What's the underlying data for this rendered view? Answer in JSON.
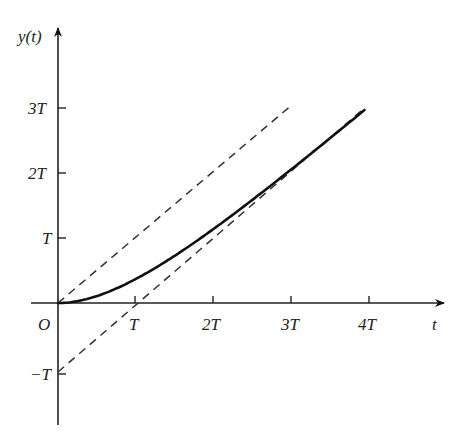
{
  "chart_data": {
    "type": "line",
    "title": "",
    "xlabel": "t",
    "ylabel": "y(t)",
    "origin_label": "O",
    "x_ticks": [
      {
        "value": 1,
        "label": "T"
      },
      {
        "value": 2,
        "label": "2T"
      },
      {
        "value": 3,
        "label": "3T"
      },
      {
        "value": 4,
        "label": "4T"
      }
    ],
    "y_ticks": [
      {
        "value": -1,
        "label": "−T"
      },
      {
        "value": 1,
        "label": "T"
      },
      {
        "value": 2,
        "label": "2T"
      },
      {
        "value": 3,
        "label": "3T"
      }
    ],
    "xlim": [
      -0.35,
      4.9
    ],
    "ylim": [
      -1.8,
      4.2
    ],
    "units": "multiples of T",
    "grid": false,
    "legend": null,
    "series": [
      {
        "name": "y(t) = t − T(1 − e^(−t/T))",
        "style": "solid",
        "color": "#111111",
        "x": [
          0,
          0.25,
          0.5,
          0.75,
          1,
          1.25,
          1.5,
          1.75,
          2,
          2.25,
          2.5,
          2.75,
          3,
          3.25,
          3.5,
          3.75,
          3.95
        ],
        "y": [
          0,
          0.029,
          0.107,
          0.222,
          0.368,
          0.537,
          0.723,
          0.924,
          1.135,
          1.355,
          1.582,
          1.814,
          2.05,
          2.289,
          2.53,
          2.774,
          2.969
        ]
      },
      {
        "name": "y = t (input ramp)",
        "style": "dashed",
        "color": "#333333",
        "x": [
          0,
          3.0
        ],
        "y": [
          0,
          3.05
        ]
      },
      {
        "name": "y = t − T (asymptote)",
        "style": "dashed",
        "color": "#333333",
        "x": [
          0,
          3.9
        ],
        "y": [
          -1,
          2.9
        ]
      }
    ],
    "annotations": []
  },
  "labels": {
    "y_axis": "y(t)",
    "x_axis": "t",
    "origin": "O",
    "x_tick_1": "T",
    "x_tick_2": "2T",
    "x_tick_3": "3T",
    "x_tick_4": "4T",
    "y_tick_neg1": "−T",
    "y_tick_1": "T",
    "y_tick_2": "2T",
    "y_tick_3": "3T"
  }
}
